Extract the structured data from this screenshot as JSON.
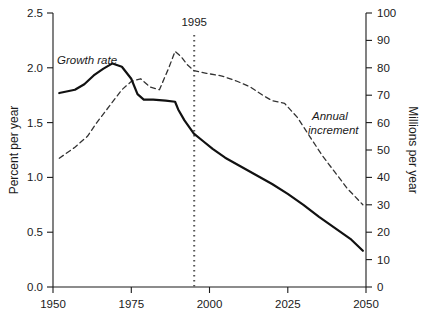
{
  "chart_data": {
    "type": "line",
    "title": "",
    "subtitle": "",
    "xlabel": "",
    "ylabel": "Percent per year",
    "y2label": "Millions per year",
    "xlim": [
      1950,
      2050
    ],
    "ylim": [
      0.0,
      2.5
    ],
    "y2lim": [
      0,
      100
    ],
    "grid": false,
    "legend_position": "inline-annotations",
    "x_ticks": [
      1950,
      1975,
      2000,
      2025,
      2050
    ],
    "x_tick_labels": [
      "1950",
      "1975",
      "2000",
      "2025",
      "2050"
    ],
    "y_ticks": [
      0.0,
      0.5,
      1.0,
      1.5,
      2.0,
      2.5
    ],
    "y_tick_labels": [
      "0.0",
      "0.5",
      "1.0",
      "1.5",
      "2.0",
      "2.5"
    ],
    "y2_ticks": [
      0,
      10,
      20,
      30,
      40,
      50,
      60,
      70,
      80,
      90,
      100
    ],
    "y2_tick_labels": [
      "0",
      "10",
      "20",
      "30",
      "40",
      "50",
      "60",
      "70",
      "80",
      "90",
      "100"
    ],
    "annotations": [
      {
        "name": "year-marker",
        "text": "1995",
        "x": 1995,
        "style": "dotted-vertical-line"
      }
    ],
    "series": [
      {
        "name": "Growth rate",
        "label": "Growth rate",
        "axis": "left",
        "units": "Percent per year",
        "style": "solid",
        "color": "#111111",
        "label_x": 1958,
        "label_y": 2.18,
        "x": [
          1952,
          1957,
          1960,
          1963,
          1966,
          1969,
          1972,
          1975,
          1977,
          1979,
          1982,
          1986,
          1989,
          1990,
          1992,
          1995,
          1998,
          2001,
          2005,
          2010,
          2015,
          2020,
          2025,
          2030,
          2035,
          2040,
          2045,
          2049
        ],
        "y": [
          1.77,
          1.8,
          1.85,
          1.93,
          1.99,
          2.04,
          2.01,
          1.9,
          1.76,
          1.71,
          1.71,
          1.7,
          1.69,
          1.62,
          1.52,
          1.4,
          1.33,
          1.26,
          1.18,
          1.1,
          1.02,
          0.94,
          0.85,
          0.75,
          0.64,
          0.54,
          0.44,
          0.33
        ]
      },
      {
        "name": "Annual increment",
        "label": "Annual increment",
        "axis": "right",
        "units": "Millions per year",
        "style": "dashed",
        "color": "#333333",
        "label_x": 2027,
        "label_y_millions": 61,
        "x": [
          1952,
          1957,
          1961,
          1964,
          1968,
          1972,
          1975,
          1978,
          1981,
          1984,
          1987,
          1989,
          1991,
          1993,
          1995,
          1999,
          2004,
          2009,
          2013,
          2017,
          2020,
          2024,
          2028,
          2032,
          2036,
          2040,
          2044,
          2049
        ],
        "y_millions": [
          47,
          51,
          55,
          60,
          66,
          72,
          75,
          76,
          73,
          72,
          80,
          86,
          84,
          81,
          79,
          78,
          77,
          75,
          73,
          70,
          68,
          67,
          62,
          55,
          48,
          42,
          36,
          30
        ]
      }
    ]
  },
  "axes": {
    "left_title": "Percent per year",
    "right_title": "Millions per year"
  }
}
